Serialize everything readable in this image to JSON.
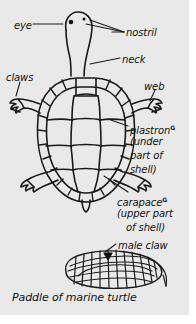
{
  "figure": {
    "caption": "Paddle of marine turtle",
    "background_color": "#e9e9e9",
    "ink_color": "#1a1a1a",
    "page_color": "#ffffff"
  },
  "labels": {
    "eye": "eye",
    "nostril": "nostril",
    "neck": "neck",
    "claws": "claws",
    "web": "web",
    "plastron": "plastron",
    "plastron_superscript": "G",
    "plastron_note_line1": "(under",
    "plastron_note_line2": "part of",
    "plastron_note_line3": "shell)",
    "carapace": "carapace",
    "carapace_superscript": "G",
    "carapace_note_line1": "(upper part",
    "carapace_note_line2": "of shell)",
    "male_claw": "male claw"
  },
  "diagrams": [
    {
      "name": "turtle-top-view",
      "parts": [
        "eye",
        "nostril",
        "neck",
        "claws",
        "web",
        "plastron",
        "carapace"
      ]
    },
    {
      "name": "marine-turtle-paddle",
      "parts": [
        "male claw"
      ],
      "caption": "Paddle of marine turtle"
    }
  ]
}
